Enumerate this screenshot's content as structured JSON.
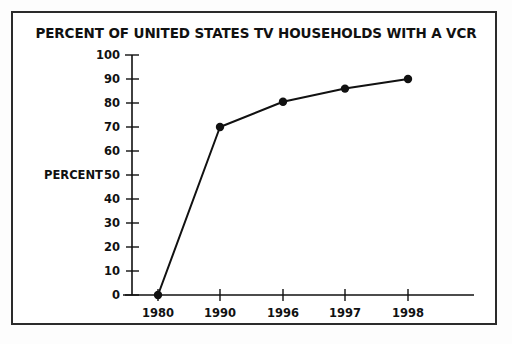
{
  "figure": {
    "border_color": "#2b2b2b",
    "background": "#ffffff",
    "ink_color": "#111111"
  },
  "chart_data": {
    "type": "line",
    "title": "PERCENT OF UNITED STATES TV HOUSEHOLDS WITH A VCR",
    "xlabel": "",
    "ylabel": "PERCENT",
    "categories": [
      "1980",
      "1990",
      "1996",
      "1997",
      "1998"
    ],
    "values": [
      0,
      70,
      80.5,
      86,
      90
    ],
    "series": [
      {
        "name": "Percent of US TV households with a VCR",
        "values": [
          0,
          70,
          80.5,
          86,
          90
        ]
      }
    ],
    "ylim": [
      0,
      100
    ],
    "y_ticks": [
      0,
      10,
      20,
      30,
      40,
      50,
      60,
      70,
      80,
      90,
      100
    ],
    "y_tick_labels": [
      "0",
      "10",
      "20",
      "30",
      "40",
      "50",
      "60",
      "70",
      "80",
      "90",
      "100"
    ],
    "x_tick_labels": [
      "1980",
      "1990",
      "1996",
      "1997",
      "1998"
    ],
    "grid": false,
    "legend": null,
    "marker": "filled-circle",
    "line_color": "#111111",
    "marker_color": "#111111"
  }
}
